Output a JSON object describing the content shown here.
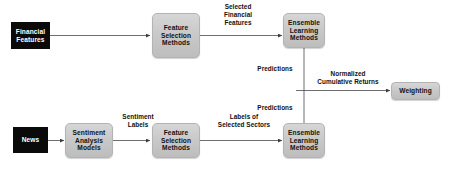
{
  "diagram": {
    "colors": {
      "source_node_fill": "#0a0a0a",
      "source_node_text": "#ffffff",
      "process_node_fill": "#c9c9c9",
      "process_node_text": "#121212",
      "edge_color": "#4a4a4a",
      "background": "#ffffff"
    },
    "nodes": [
      {
        "id": "financial-features",
        "type": "source",
        "lines": [
          "Financial",
          "Features"
        ]
      },
      {
        "id": "feature-selection-methods-top",
        "type": "process",
        "lines": [
          "Feature",
          "Selection",
          "Methods"
        ]
      },
      {
        "id": "ensemble-learning-methods-top",
        "type": "process",
        "lines": [
          "Ensemble",
          "Learning",
          "Methods"
        ]
      },
      {
        "id": "weighting",
        "type": "process",
        "lines": [
          "Weighting"
        ]
      },
      {
        "id": "news",
        "type": "source",
        "lines": [
          "News"
        ]
      },
      {
        "id": "sentiment-analysis-models",
        "type": "process",
        "lines": [
          "Sentiment",
          "Analysis",
          "Models"
        ]
      },
      {
        "id": "feature-selection-methods-bottom",
        "type": "process",
        "lines": [
          "Feature",
          "Selection",
          "Methods"
        ]
      },
      {
        "id": "ensemble-learning-methods-bottom",
        "type": "process",
        "lines": [
          "Ensemble",
          "Learning",
          "Methods"
        ]
      }
    ],
    "edge_labels": [
      {
        "id": "selected-financial-features",
        "lines": [
          "Selected",
          "Financial",
          "Features"
        ]
      },
      {
        "id": "predictions-top",
        "lines": [
          "Predictions"
        ]
      },
      {
        "id": "normalized-cumulative-returns",
        "lines": [
          "Normalized",
          "Cumulative Returns"
        ]
      },
      {
        "id": "predictions-bottom",
        "lines": [
          "Predictions"
        ]
      },
      {
        "id": "sentiment-labels",
        "lines": [
          "Sentiment",
          "Labels"
        ]
      },
      {
        "id": "labels-of-selected-sectors",
        "lines": [
          "Labels of",
          "Selected Sectors"
        ]
      }
    ]
  }
}
